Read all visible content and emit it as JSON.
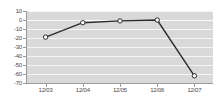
{
  "chart_data": {
    "type": "line",
    "title": "",
    "xlabel": "",
    "ylabel": "",
    "categories": [
      "12/03",
      "12/04",
      "12/05",
      "12/06",
      "12/07"
    ],
    "values": [
      -19,
      -3,
      -1,
      0,
      -62
    ],
    "series": [
      {
        "name": "",
        "values": [
          -19,
          -3,
          -1,
          0,
          -62
        ]
      }
    ],
    "ylim": [
      -70,
      10
    ],
    "yticks": [
      10,
      0,
      -10,
      -20,
      -30,
      -40,
      -50,
      -60,
      -70
    ],
    "ytick_labels": [
      "10",
      "0",
      "-10",
      "-20",
      "-30",
      "-40",
      "-50",
      "-60",
      "-70"
    ],
    "grid": true,
    "legend": "none",
    "plot_background": "#d9d9d9",
    "gridline_color": "#f5f5f5",
    "line_color": "#2b2b2b",
    "marker_fill": "#ffffff",
    "axis_color": "#9a9a9a",
    "label_color": "#4a4a4a"
  }
}
